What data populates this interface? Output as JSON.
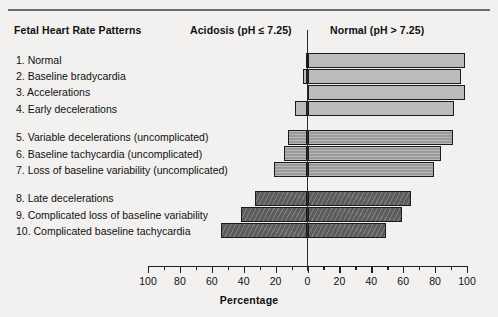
{
  "header": {
    "patterns_label": "Fetal Heart Rate Patterns",
    "acidosis_label": "Acidosis (pH ≤ 7.25)",
    "normal_label": "Normal (pH > 7.25)"
  },
  "axis": {
    "title": "Percentage",
    "tick_labels": [
      "100",
      "80",
      "60",
      "40",
      "20",
      "0",
      "20",
      "40",
      "60",
      "80",
      "100"
    ]
  },
  "colors": {
    "background": "#f2f1ef",
    "group1_fill": "#bcbcbc",
    "group2_fill": "#9a9a9a",
    "group3_fill": "#5c5c5c",
    "bar_outline": "#1b1b1b",
    "axis": "#1f1f1f",
    "rule": "#6e6e6e"
  },
  "chart_data": {
    "type": "bar",
    "orientation": "horizontal-diverging",
    "title": "",
    "xlabel": "Percentage",
    "ylabel": "Fetal Heart Rate Patterns",
    "xlim": [
      -100,
      100
    ],
    "xticks": [
      -100,
      -80,
      -60,
      -40,
      -20,
      0,
      20,
      40,
      60,
      80,
      100
    ],
    "xtick_labels": [
      "100",
      "80",
      "60",
      "40",
      "20",
      "0",
      "20",
      "40",
      "60",
      "80",
      "100"
    ],
    "grid": false,
    "legend": [
      "Acidosis (pH ≤ 7.25)",
      "Normal (pH > 7.25)"
    ],
    "legend_position": "top",
    "groups": [
      {
        "name": "group-1",
        "shade": "light",
        "categories": [
          "1. Normal",
          "2. Baseline bradycardia",
          "3. Accelerations",
          "4. Early decelerations"
        ],
        "acidosis": [
          1,
          3,
          0,
          8
        ],
        "normal": [
          99,
          96,
          99,
          92
        ]
      },
      {
        "name": "group-2",
        "shade": "medium",
        "categories": [
          "5. Variable decelerations (uncomplicated)",
          "6. Baseline tachycardia (uncomplicated)",
          "7. Loss of baseline variability (uncomplicated)"
        ],
        "acidosis": [
          12,
          15,
          21
        ],
        "normal": [
          91,
          84,
          79
        ]
      },
      {
        "name": "group-3",
        "shade": "dark",
        "categories": [
          "8. Late decelerations",
          "9. Complicated loss of baseline variability",
          "10. Complicated baseline tachycardia"
        ],
        "acidosis": [
          33,
          42,
          54
        ],
        "normal": [
          65,
          59,
          49
        ]
      }
    ],
    "series": [
      {
        "name": "Acidosis (pH ≤ 7.25)",
        "side": "left",
        "values": [
          1,
          3,
          0,
          8,
          12,
          15,
          21,
          33,
          42,
          54
        ]
      },
      {
        "name": "Normal (pH > 7.25)",
        "side": "right",
        "values": [
          99,
          96,
          99,
          92,
          91,
          84,
          79,
          65,
          59,
          49
        ]
      }
    ],
    "categories": [
      "1. Normal",
      "2. Baseline bradycardia",
      "3. Accelerations",
      "4. Early decelerations",
      "5. Variable decelerations (uncomplicated)",
      "6. Baseline tachycardia (uncomplicated)",
      "7. Loss of baseline variability (uncomplicated)",
      "8. Late decelerations",
      "9. Complicated loss of baseline variability",
      "10. Complicated baseline tachycardia"
    ]
  }
}
